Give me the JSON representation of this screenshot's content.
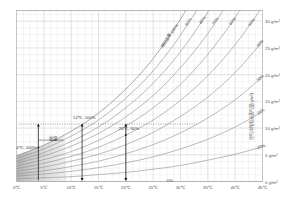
{
  "chart_data": {
    "type": "line",
    "title": "",
    "xlabel": "",
    "ylabel": "空气中饱和水蒸气量(g/m³)",
    "xlim": [
      0,
      45
    ],
    "ylim": [
      0,
      32
    ],
    "grid": true,
    "legend_position": "inline-curve-labels",
    "x_ticks": [
      "0℃",
      "5℃",
      "10℃",
      "15℃",
      "20℃",
      "25℃",
      "30℃",
      "35℃",
      "40℃",
      "45℃"
    ],
    "x_tick_values": [
      0,
      5,
      10,
      15,
      20,
      25,
      30,
      35,
      40,
      45
    ],
    "y_ticks": [
      "30 g/m³",
      "25 g/m³",
      "20 g/m³",
      "15 g/m³",
      "10 g/m³",
      "5 g/m³",
      "0 g/m³"
    ],
    "y_tick_values": [
      30,
      25,
      20,
      15,
      10,
      5,
      0
    ],
    "x": [
      0,
      5,
      10,
      15,
      20,
      25,
      30,
      35,
      40,
      45
    ],
    "series": [
      {
        "name": "相对湿度 100%",
        "label": "相对湿度 100%",
        "percent": 100,
        "values": [
          4.8,
          6.8,
          9.4,
          12.8,
          17.3,
          23.0,
          30.4,
          39.6,
          51.1,
          65.4
        ]
      },
      {
        "name": "90%",
        "label": "90%",
        "percent": 90,
        "values": [
          4.3,
          6.1,
          8.5,
          11.5,
          15.6,
          20.7,
          27.4,
          35.6,
          46.0,
          58.9
        ]
      },
      {
        "name": "80%",
        "label": "80%",
        "percent": 80,
        "values": [
          3.8,
          5.4,
          7.5,
          10.2,
          13.8,
          18.4,
          24.3,
          31.7,
          40.9,
          52.3
        ]
      },
      {
        "name": "70%",
        "label": "70%",
        "percent": 70,
        "values": [
          3.4,
          4.8,
          6.6,
          9.0,
          12.1,
          16.1,
          21.3,
          27.7,
          35.8,
          45.8
        ]
      },
      {
        "name": "60%",
        "label": "60%",
        "percent": 60,
        "values": [
          2.9,
          4.1,
          5.6,
          7.7,
          10.4,
          13.8,
          18.2,
          23.8,
          30.7,
          39.2
        ]
      },
      {
        "name": "50%",
        "label": "50%",
        "percent": 50,
        "values": [
          2.4,
          3.4,
          4.7,
          6.4,
          8.7,
          11.5,
          15.2,
          19.8,
          25.6,
          32.7
        ]
      },
      {
        "name": "40%",
        "label": "40%",
        "percent": 40,
        "values": [
          1.9,
          2.7,
          3.8,
          5.1,
          6.9,
          9.2,
          12.2,
          15.8,
          20.4,
          26.2
        ]
      },
      {
        "name": "30%",
        "label": "30%",
        "percent": 30,
        "values": [
          1.4,
          2.0,
          2.8,
          3.8,
          5.2,
          6.9,
          9.1,
          11.9,
          15.3,
          19.6
        ]
      },
      {
        "name": "20%",
        "label": "20%",
        "percent": 20,
        "values": [
          1.0,
          1.4,
          1.9,
          2.6,
          3.5,
          4.6,
          6.1,
          7.9,
          10.2,
          13.1
        ]
      },
      {
        "name": "10%",
        "label": "10%",
        "percent": 10,
        "values": [
          0.5,
          0.7,
          0.9,
          1.3,
          1.7,
          2.3,
          3.0,
          4.0,
          5.1,
          6.5
        ]
      },
      {
        "name": "0%",
        "label": "0%",
        "percent": 0,
        "values": [
          0,
          0,
          0,
          0,
          0,
          0,
          0,
          0,
          0,
          0
        ]
      }
    ],
    "annotations": [
      {
        "name": "point-4c-100",
        "text": "4℃, 100%",
        "x": 4,
        "y": 6.4
      },
      {
        "name": "point-12c-100",
        "text": "12℃, 100%",
        "x": 12,
        "y": 10.7
      },
      {
        "name": "point-20c-50",
        "text": "20℃, 50%",
        "x": 20,
        "y": 8.7
      },
      {
        "name": "humidify-label",
        "text": "加湿",
        "x": 6.5,
        "y": 8.2
      }
    ],
    "shaded_region": {
      "name": "saturation-shade",
      "description": "gray wedge below 100% curve at low temperature"
    }
  },
  "axes": {
    "y_right_title": "空气中饱和水蒸气量(g/m³)"
  },
  "colors": {
    "curve": "#8d8d8d",
    "grid": "#e2e2e2",
    "frame": "#b9b9b9",
    "text": "#555555",
    "annotation": "#2d2d2d",
    "shade": "#b3b3b3",
    "marker": "#1a1a1a"
  }
}
